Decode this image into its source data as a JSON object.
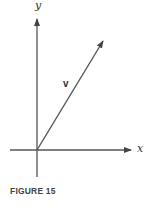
{
  "figure": {
    "caption": "FIGURE 15",
    "labels": {
      "y_axis": "y",
      "x_axis": "x",
      "vector": "v"
    },
    "colors": {
      "line": "#555555",
      "text": "#333333"
    }
  }
}
